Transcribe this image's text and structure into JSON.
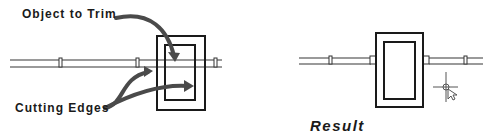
{
  "diagram": {
    "before": {
      "label_object": "Object to Trim",
      "label_edges": "Cutting Edges"
    },
    "after": {
      "label_result": "Result"
    },
    "colors": {
      "line": "#1a1a1a",
      "pipe": "#9a9a9a",
      "arrow": "#4a4a4a"
    }
  }
}
